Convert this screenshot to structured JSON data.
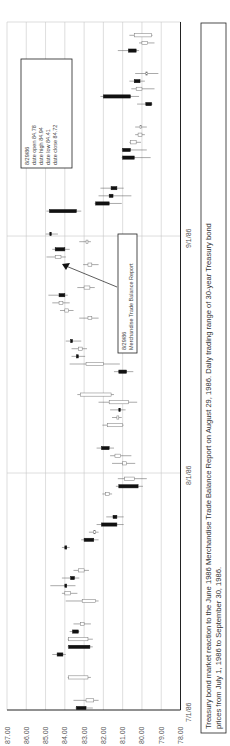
{
  "chart_data": {
    "type": "candlestick",
    "orientation": "rotated-90-ccw",
    "title": "",
    "caption": "Treasury bond market reaction to the June 1986 Merchandise Trade Balance Report on August 29, 1986. Daily trading range of 30-year Treasury bond prices from July 1, 1986 to September 30, 1986.",
    "caption_lines": [
      "Treasury bond market reaction to the June 1986 Merchandise Trade Balance Report on August 29, 1986. Daily trading range of 30-year Treasury bond",
      "prices from July 1, 1986 to September 30, 1986."
    ],
    "price_axis": {
      "ticks": [
        "87.00",
        "86.00",
        "85.00",
        "84.00",
        "83.00",
        "82.00",
        "81.00",
        "80.00",
        "79.00",
        "78.00"
      ],
      "range": [
        78,
        87
      ]
    },
    "date_axis": {
      "ticks": [
        "7/1/86",
        "8/1/86",
        "9/1/86"
      ],
      "range": [
        "7/1/86",
        "9/30/86"
      ]
    },
    "grid": true,
    "info_box": {
      "date": "8/29/86",
      "lines": [
        "8/29/86",
        "date open  84.78",
        "date high  84.94",
        "date low  84.41",
        "date close  84.72"
      ]
    },
    "annotation": {
      "lines": [
        "8/29/86",
        "Merchandise Trade Balance Report"
      ]
    },
    "series": [
      {
        "day": 1,
        "open": 82.9,
        "high": 83.2,
        "low": 82.6,
        "close": 83.4,
        "filled": true
      },
      {
        "day": 2,
        "open": 82.9,
        "high": 83.5,
        "low": 82.3,
        "close": 82.5,
        "filled": false
      },
      {
        "day": 5,
        "open": 83.8,
        "high": 83.8,
        "low": 82.7,
        "close": 82.8,
        "filled": false
      },
      {
        "day": 8,
        "open": 84.4,
        "high": 84.6,
        "low": 84.0,
        "close": 84.1,
        "filled": true
      },
      {
        "day": 9,
        "open": 82.7,
        "high": 83.8,
        "low": 82.6,
        "close": 83.8,
        "filled": true
      },
      {
        "day": 10,
        "open": 83.8,
        "high": 83.8,
        "low": 82.6,
        "close": 82.8,
        "filled": false
      },
      {
        "day": 11,
        "open": 83.6,
        "high": 83.7,
        "low": 83.3,
        "close": 83.3,
        "filled": true
      },
      {
        "day": 12,
        "open": 83.2,
        "high": 83.5,
        "low": 82.7,
        "close": 83.0,
        "filled": false
      },
      {
        "day": 15,
        "open": 83.1,
        "high": 83.9,
        "low": 82.3,
        "close": 82.4,
        "filled": false
      },
      {
        "day": 16,
        "open": 84.0,
        "high": 84.1,
        "low": 83.4,
        "close": 83.7,
        "filled": false
      },
      {
        "day": 17,
        "open": 83.9,
        "high": 84.7,
        "low": 83.5,
        "close": 84.0,
        "filled": true
      },
      {
        "day": 18,
        "open": 83.7,
        "high": 84.1,
        "low": 83.3,
        "close": 83.5,
        "filled": true
      },
      {
        "day": 19,
        "open": 83.3,
        "high": 83.5,
        "low": 82.8,
        "close": 83.0,
        "filled": false
      },
      {
        "day": 22,
        "open": 84.0,
        "high": 84.1,
        "low": 83.8,
        "close": 83.9,
        "filled": true
      },
      {
        "day": 23,
        "open": 82.5,
        "high": 83.1,
        "low": 82.3,
        "close": 83.0,
        "filled": true
      },
      {
        "day": 24,
        "open": 82.5,
        "high": 82.7,
        "low": 82.3,
        "close": 82.4,
        "filled": false
      },
      {
        "day": 25,
        "open": 81.3,
        "high": 82.3,
        "low": 81.0,
        "close": 82.1,
        "filled": true
      },
      {
        "day": 26,
        "open": 81.3,
        "high": 81.8,
        "low": 81.0,
        "close": 81.5,
        "filled": true
      },
      {
        "day": 29,
        "open": 81.9,
        "high": 82.0,
        "low": 81.6,
        "close": 81.7,
        "filled": false
      },
      {
        "day": 30,
        "open": 80.2,
        "high": 81.3,
        "low": 80.0,
        "close": 81.2,
        "filled": true
      },
      {
        "day": 31,
        "open": 80.4,
        "high": 81.2,
        "low": 79.8,
        "close": 80.9,
        "filled": false
      },
      {
        "day": 33,
        "open": 80.8,
        "high": 81.5,
        "low": 80.4,
        "close": 81.0,
        "filled": false
      },
      {
        "day": 34,
        "open": 81.1,
        "high": 81.6,
        "low": 80.6,
        "close": 81.4,
        "filled": false
      },
      {
        "day": 35,
        "open": 82.1,
        "high": 82.3,
        "low": 81.5,
        "close": 81.7,
        "filled": true
      },
      {
        "day": 38,
        "open": 81.8,
        "high": 82.0,
        "low": 81.5,
        "close": 81.0,
        "filled": false
      },
      {
        "day": 39,
        "open": 81.3,
        "high": 81.5,
        "low": 81.1,
        "close": 81.2,
        "filled": false
      },
      {
        "day": 40,
        "open": 81.2,
        "high": 81.6,
        "low": 80.9,
        "close": 81.2,
        "filled": true
      },
      {
        "day": 41,
        "open": 81.7,
        "high": 82.2,
        "low": 80.3,
        "close": 80.7,
        "filled": false
      },
      {
        "day": 42,
        "open": 83.2,
        "high": 83.3,
        "low": 81.5,
        "close": 81.6,
        "filled": false
      },
      {
        "day": 45,
        "open": 80.8,
        "high": 81.4,
        "low": 80.5,
        "close": 81.2,
        "filled": true
      },
      {
        "day": 46,
        "open": 82.0,
        "high": 83.7,
        "low": 81.2,
        "close": 82.9,
        "filled": false
      },
      {
        "day": 47,
        "open": 83.4,
        "high": 83.6,
        "low": 83.0,
        "close": 83.3,
        "filled": true
      },
      {
        "day": 48,
        "open": 83.3,
        "high": 83.6,
        "low": 82.9,
        "close": 83.1,
        "filled": false
      },
      {
        "day": 49,
        "open": 83.6,
        "high": 83.9,
        "low": 83.2,
        "close": 83.7,
        "filled": true
      },
      {
        "day": 52,
        "open": 82.8,
        "high": 83.2,
        "low": 82.3,
        "close": 82.6,
        "filled": false
      },
      {
        "day": 53,
        "open": 84.0,
        "high": 84.2,
        "low": 83.6,
        "close": 83.8,
        "filled": false
      },
      {
        "day": 54,
        "open": 84.3,
        "high": 84.6,
        "low": 83.8,
        "close": 84.1,
        "filled": false
      },
      {
        "day": 55,
        "open": 84.0,
        "high": 84.8,
        "low": 83.9,
        "close": 84.3,
        "filled": true
      },
      {
        "day": 56,
        "open": 83.0,
        "high": 83.3,
        "low": 82.5,
        "close": 82.7,
        "filled": false
      },
      {
        "day": 59,
        "open": 82.6,
        "high": 83.0,
        "low": 82.3,
        "close": 82.8,
        "filled": false
      },
      {
        "day": 60,
        "open": 84.5,
        "high": 84.9,
        "low": 84.0,
        "close": 84.2,
        "filled": false
      },
      {
        "day": 61,
        "open": 84.0,
        "high": 84.6,
        "low": 83.8,
        "close": 84.5,
        "filled": true
      },
      {
        "day": 62,
        "open": 82.8,
        "high": 83.2,
        "low": 82.7,
        "close": 82.9,
        "filled": false
      },
      {
        "day": 63,
        "open": 84.78,
        "high": 84.94,
        "low": 84.41,
        "close": 84.72,
        "filled": true
      },
      {
        "day": 66,
        "open": 83.4,
        "high": 84.9,
        "low": 83.2,
        "close": 84.8,
        "filled": true
      },
      {
        "day": 67,
        "open": 81.7,
        "high": 82.3,
        "low": 81.1,
        "close": 82.4,
        "filled": true
      },
      {
        "day": 68,
        "open": 81.7,
        "high": 82.2,
        "low": 80.6,
        "close": 81.5,
        "filled": true
      },
      {
        "day": 69,
        "open": 81.6,
        "high": 82.1,
        "low": 81.0,
        "close": 81.3,
        "filled": true
      },
      {
        "day": 73,
        "open": 80.4,
        "high": 80.9,
        "low": 79.6,
        "close": 81.0,
        "filled": true
      },
      {
        "day": 74,
        "open": 80.6,
        "high": 80.9,
        "low": 79.8,
        "close": 81.0,
        "filled": true
      },
      {
        "day": 75,
        "open": 80.3,
        "high": 80.6,
        "low": 80.1,
        "close": 80.6,
        "filled": false
      },
      {
        "day": 76,
        "open": 80.0,
        "high": 80.3,
        "low": 79.9,
        "close": 80.2,
        "filled": false
      },
      {
        "day": 77,
        "open": 80.1,
        "high": 80.3,
        "low": 79.8,
        "close": 80.1,
        "filled": false
      },
      {
        "day": 80,
        "open": 79.5,
        "high": 80.2,
        "low": 79.6,
        "close": 79.8,
        "filled": true
      },
      {
        "day": 81,
        "open": 80.6,
        "high": 82.1,
        "low": 80.2,
        "close": 82.0,
        "filled": true
      },
      {
        "day": 82,
        "open": 80.0,
        "high": 80.5,
        "low": 79.4,
        "close": 80.3,
        "filled": false
      },
      {
        "day": 83,
        "open": 80.1,
        "high": 80.6,
        "low": 79.9,
        "close": 80.4,
        "filled": true
      },
      {
        "day": 84,
        "open": 79.7,
        "high": 80.3,
        "low": 79.2,
        "close": 79.8,
        "filled": false
      },
      {
        "day": 87,
        "open": 80.7,
        "high": 81.2,
        "low": 80.2,
        "close": 80.3,
        "filled": true
      },
      {
        "day": 88,
        "open": 79.7,
        "high": 80.1,
        "low": 79.4,
        "close": 80.0,
        "filled": false
      },
      {
        "day": 89,
        "open": 79.5,
        "high": 80.6,
        "low": 79.5,
        "close": 80.4,
        "filled": false
      }
    ]
  }
}
